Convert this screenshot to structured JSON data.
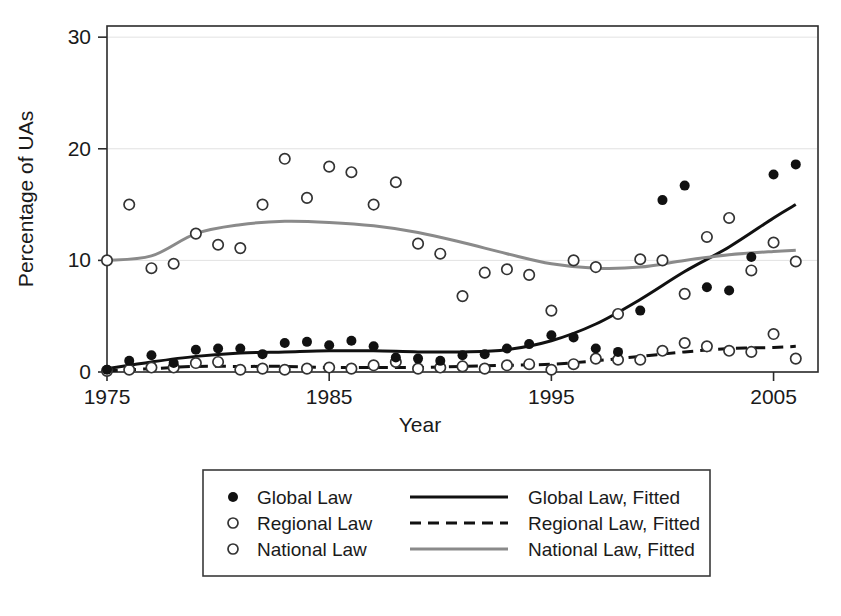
{
  "chart_data": {
    "type": "scatter",
    "title": "",
    "xlabel": "Year",
    "ylabel": "Percentage of UAs",
    "xlim": [
      1975,
      2007
    ],
    "ylim": [
      0,
      31
    ],
    "xticks": [
      1975,
      1985,
      1995,
      2005
    ],
    "xtick_labels": [
      "1975",
      "1985",
      "1995",
      "2005"
    ],
    "yticks": [
      0,
      10,
      20,
      30
    ],
    "ytick_labels": [
      "0",
      "10",
      "20",
      "30"
    ],
    "grid": "horizontal-light",
    "legend_position": "below-plot",
    "series": [
      {
        "name": "Global Law",
        "marker": "filled-circle",
        "color": "#111111",
        "x": [
          1975,
          1976,
          1977,
          1978,
          1979,
          1980,
          1981,
          1982,
          1983,
          1984,
          1985,
          1986,
          1987,
          1988,
          1989,
          1990,
          1991,
          1992,
          1993,
          1994,
          1995,
          1996,
          1997,
          1998,
          1999,
          2000,
          2001,
          2002,
          2003,
          2004,
          2005,
          2006
        ],
        "y": [
          0.2,
          1.0,
          1.5,
          0.8,
          2.0,
          2.1,
          2.1,
          1.6,
          2.6,
          2.7,
          2.4,
          2.8,
          2.3,
          1.3,
          1.2,
          1.0,
          1.5,
          1.6,
          2.1,
          2.5,
          3.3,
          3.1,
          2.1,
          1.8,
          5.5,
          15.4,
          16.7,
          7.6,
          7.3,
          10.3,
          17.7,
          18.6
        ]
      },
      {
        "name": "Regional Law",
        "marker": "open-circle",
        "color": "#ffffff",
        "x": [
          1975,
          1976,
          1977,
          1978,
          1979,
          1980,
          1981,
          1982,
          1983,
          1984,
          1985,
          1986,
          1987,
          1988,
          1989,
          1990,
          1991,
          1992,
          1993,
          1994,
          1995,
          1996,
          1997,
          1998,
          1999,
          2000,
          2001,
          2002,
          2003,
          2004,
          2005,
          2006
        ],
        "y": [
          0.1,
          0.2,
          0.4,
          0.4,
          0.8,
          0.9,
          0.2,
          0.3,
          0.2,
          0.3,
          0.4,
          0.3,
          0.6,
          0.9,
          0.3,
          0.4,
          0.5,
          0.3,
          0.6,
          0.7,
          0.2,
          0.7,
          1.2,
          1.1,
          1.1,
          1.9,
          2.6,
          2.3,
          1.9,
          1.8,
          3.4,
          1.2
        ]
      },
      {
        "name": "National Law",
        "marker": "open-circle",
        "color": "#ffffff",
        "x": [
          1975,
          1976,
          1977,
          1978,
          1979,
          1980,
          1981,
          1982,
          1983,
          1984,
          1985,
          1986,
          1987,
          1988,
          1989,
          1990,
          1991,
          1992,
          1993,
          1994,
          1995,
          1996,
          1997,
          1998,
          1999,
          2000,
          2001,
          2002,
          2003,
          2004,
          2005,
          2006
        ],
        "y": [
          10.0,
          15.0,
          9.3,
          9.7,
          12.4,
          11.4,
          11.1,
          15.0,
          19.1,
          15.6,
          18.4,
          17.9,
          15.0,
          17.0,
          11.5,
          10.6,
          6.8,
          8.9,
          9.2,
          8.7,
          5.5,
          10.0,
          9.4,
          5.2,
          10.1,
          10.0,
          7.0,
          12.1,
          13.8,
          9.1,
          11.6,
          9.9
        ]
      }
    ],
    "fits": [
      {
        "name": "Global Law, Fitted",
        "style": "solid",
        "color": "#111111",
        "x": [
          1975,
          1977,
          1979,
          1981,
          1983,
          1985,
          1987,
          1989,
          1991,
          1993,
          1995,
          1997,
          1999,
          2001,
          2003,
          2005,
          2006
        ],
        "y": [
          0.3,
          0.9,
          1.4,
          1.7,
          1.8,
          1.9,
          1.9,
          1.8,
          1.8,
          2.0,
          2.8,
          4.3,
          6.5,
          9.0,
          11.2,
          13.8,
          15.0
        ]
      },
      {
        "name": "Regional Law, Fitted",
        "style": "dashed",
        "color": "#111111",
        "x": [
          1975,
          1977,
          1979,
          1981,
          1983,
          1985,
          1987,
          1989,
          1991,
          1993,
          1995,
          1997,
          1999,
          2001,
          2003,
          2005,
          2006
        ],
        "y": [
          0.1,
          0.3,
          0.5,
          0.5,
          0.5,
          0.4,
          0.4,
          0.4,
          0.5,
          0.6,
          0.7,
          1.0,
          1.4,
          1.8,
          2.1,
          2.2,
          2.3
        ]
      },
      {
        "name": "National Law, Fitted",
        "style": "solid",
        "color": "#8a8a8a",
        "x": [
          1975,
          1977,
          1979,
          1981,
          1983,
          1985,
          1987,
          1989,
          1991,
          1993,
          1995,
          1997,
          1999,
          2001,
          2003,
          2005,
          2006
        ],
        "y": [
          10.0,
          10.4,
          12.4,
          13.2,
          13.5,
          13.4,
          13.1,
          12.5,
          11.6,
          10.6,
          9.7,
          9.3,
          9.4,
          10.0,
          10.5,
          10.8,
          10.9
        ]
      }
    ]
  },
  "axis": {
    "x_title": "Year",
    "y_title": "Percentage of UAs"
  },
  "legend": {
    "rows": [
      {
        "marker_label": "Global Law",
        "line_label": "Global Law, Fitted"
      },
      {
        "marker_label": "Regional Law",
        "line_label": "Regional Law, Fitted"
      },
      {
        "marker_label": "National Law",
        "line_label": "National Law, Fitted"
      }
    ]
  }
}
